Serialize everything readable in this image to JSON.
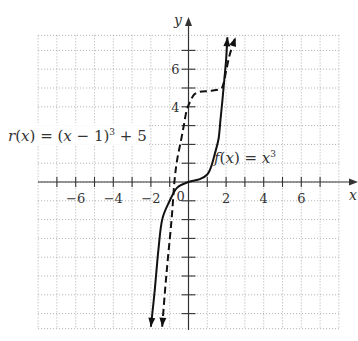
{
  "chart_data": {
    "type": "line",
    "title": "",
    "xlabel": "x",
    "ylabel": "y",
    "xlim": [
      -8,
      8
    ],
    "ylim": [
      -8,
      8
    ],
    "grid": true,
    "x_ticks": [
      -6,
      -4,
      -2,
      2,
      4,
      6
    ],
    "y_ticks": [
      4,
      6
    ],
    "origin_label": "0",
    "series": [
      {
        "name": "f(x) = x³",
        "style": "solid",
        "label_parts": {
          "fn": "f",
          "arg": "x",
          "rhs_base": "x",
          "exp": "3"
        },
        "points": [
          [
            -2.0,
            -7.7
          ],
          [
            -1.8,
            -5.8
          ],
          [
            -1.6,
            -3.6
          ],
          [
            -1.4,
            -2.0
          ],
          [
            -1.0,
            -1.0
          ],
          [
            -0.6,
            -0.3
          ],
          [
            0,
            0
          ],
          [
            0.6,
            0.15
          ],
          [
            1.0,
            0.4
          ],
          [
            1.2,
            0.8
          ],
          [
            1.4,
            1.5
          ],
          [
            1.6,
            2.3
          ],
          [
            1.7,
            3.3
          ],
          [
            1.8,
            4.3
          ],
          [
            1.9,
            5.4
          ],
          [
            2.0,
            6.5
          ],
          [
            2.07,
            7.7
          ]
        ]
      },
      {
        "name": "r(x) = (x − 1)³ + 5",
        "style": "dashed",
        "label_parts": {
          "fn": "r",
          "arg": "x",
          "inner": "x − 1",
          "exp": "3",
          "plus": "+ 5"
        },
        "points": [
          [
            -1.4,
            -7.7
          ],
          [
            -1.25,
            -5.8
          ],
          [
            -1.1,
            -4.1
          ],
          [
            -0.9,
            -2.0
          ],
          [
            -0.75,
            0
          ],
          [
            -0.6,
            1.2
          ],
          [
            -0.4,
            2.2
          ],
          [
            -0.25,
            3.0
          ],
          [
            -0.1,
            3.8
          ],
          [
            0.1,
            4.3
          ],
          [
            0.3,
            4.65
          ],
          [
            0.6,
            4.8
          ],
          [
            1.2,
            4.85
          ],
          [
            1.7,
            4.95
          ],
          [
            1.85,
            5.2
          ],
          [
            2.0,
            5.9
          ],
          [
            2.2,
            6.8
          ],
          [
            2.5,
            7.7
          ]
        ]
      }
    ]
  },
  "labels": {
    "r_label": {
      "fn": "r",
      "open": "(",
      "arg": "x",
      "close": ")",
      "eq": " = (",
      "inner_var": "x",
      "inner_rest": " − 1)",
      "exp": "3",
      "tail": " + 5"
    },
    "f_label": {
      "fn": "f",
      "open": "(",
      "arg": "x",
      "close": ")",
      "eq": " = ",
      "base": "x",
      "exp": "3"
    }
  }
}
